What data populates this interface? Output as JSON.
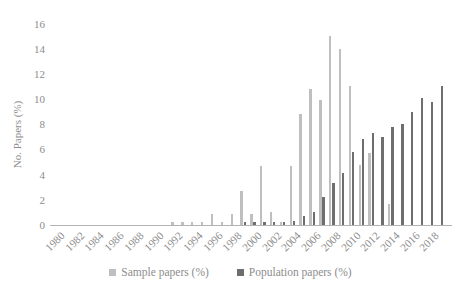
{
  "chart_data": {
    "type": "bar",
    "title": "",
    "xlabel": "",
    "ylabel": "No. Papers (%)",
    "ylim": [
      0,
      16
    ],
    "ytick_step": 2,
    "grid": false,
    "legend_position": "bottom",
    "x_label_interval": 2,
    "categories": [
      "1980",
      "1981",
      "1982",
      "1983",
      "1984",
      "1985",
      "1986",
      "1987",
      "1988",
      "1989",
      "1990",
      "1991",
      "1992",
      "1993",
      "1994",
      "1995",
      "1996",
      "1997",
      "1998",
      "1999",
      "2000",
      "2001",
      "2002",
      "2003",
      "2004",
      "2005",
      "2006",
      "2007",
      "2008",
      "2009",
      "2010",
      "2011",
      "2012",
      "2013",
      "2014",
      "2015",
      "2016",
      "2017",
      "2018",
      "2019"
    ],
    "series": [
      {
        "name": "Sample papers (%)",
        "color": "#bfbfbf",
        "values": [
          0,
          0,
          0,
          0,
          0,
          0,
          0,
          0,
          0,
          0,
          0,
          0,
          0.2,
          0.2,
          0.2,
          0.2,
          0.9,
          0.2,
          0.9,
          2.7,
          0.9,
          4.7,
          1.0,
          0.2,
          4.7,
          8.8,
          10.8,
          9.9,
          15,
          14,
          11,
          4.8,
          5.7,
          0,
          1.7,
          0,
          0,
          0,
          0,
          0
        ]
      },
      {
        "name": "Population papers (%)",
        "color": "#6e6e6e",
        "values": [
          0,
          0,
          0,
          0,
          0,
          0,
          0,
          0,
          0,
          0,
          0,
          0,
          0,
          0,
          0,
          0,
          0,
          0,
          0,
          0.2,
          0.2,
          0.2,
          0.2,
          0.2,
          0.3,
          0.7,
          1.0,
          2.2,
          3.3,
          4.1,
          5.8,
          6.8,
          7.3,
          7.0,
          7.8,
          8.0,
          9.0,
          10.1,
          9.8,
          11.0
        ]
      }
    ],
    "axis_text_color": "#8c8c8c",
    "axis_line_color": "#b3b3b3"
  }
}
